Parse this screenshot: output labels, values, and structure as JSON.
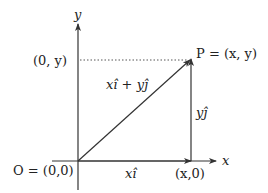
{
  "diagram": {
    "type": "vector-decomposition",
    "colors": {
      "stroke": "#333333",
      "text": "#222222",
      "background": "#ffffff"
    },
    "axes": {
      "x_label": "x",
      "y_label": "y"
    },
    "points": {
      "origin": "O = (0,0)",
      "P": "P = (x, y)",
      "x_intercept": "(x,0)",
      "y_intercept": "(0, y)"
    },
    "vectors": {
      "sum": "xî + yĵ",
      "x_component": "xî",
      "y_component": "yĵ"
    }
  }
}
